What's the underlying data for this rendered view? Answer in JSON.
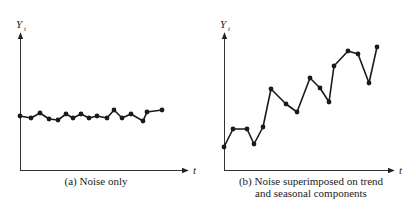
{
  "chart_data": [
    {
      "type": "line",
      "title": "(a) Noise only",
      "xlabel": "t",
      "ylabel": "Y_t",
      "ylabel_main": "Y",
      "ylabel_sub": "t",
      "grid": false,
      "legend": null,
      "markers": true,
      "x": [
        1,
        2,
        3,
        4,
        5,
        6,
        7,
        8,
        9,
        10,
        11,
        12,
        13,
        14,
        15,
        16,
        17
      ],
      "values": [
        116,
        118,
        113,
        119,
        120,
        114,
        118,
        114,
        118,
        116,
        118,
        110,
        118,
        114,
        121,
        112,
        110
      ],
      "pixel_points": [
        [
          20,
          116
        ],
        [
          31,
          118
        ],
        [
          40,
          113
        ],
        [
          49,
          119
        ],
        [
          58,
          120
        ],
        [
          66,
          114
        ],
        [
          73,
          118
        ],
        [
          81,
          114
        ],
        [
          89,
          118
        ],
        [
          97,
          116
        ],
        [
          107,
          118
        ],
        [
          114,
          110
        ],
        [
          122,
          118
        ],
        [
          131,
          114
        ],
        [
          143,
          121
        ],
        [
          147,
          112
        ],
        [
          162,
          110
        ]
      ]
    },
    {
      "type": "line",
      "title": "(b) Noise superimposed on trend and seasonal components",
      "title_lines": [
        "(b) Noise superimposed on trend",
        "and seasonal components"
      ],
      "xlabel": "t",
      "ylabel": "Y_t",
      "ylabel_main": "Y",
      "ylabel_sub": "t",
      "grid": false,
      "legend": null,
      "markers": true,
      "x": [
        1,
        2,
        3,
        4,
        5,
        6,
        7,
        8,
        9,
        10,
        11,
        12,
        13,
        14,
        15,
        16
      ],
      "pixel_points": [
        [
          224,
          147
        ],
        [
          233,
          129
        ],
        [
          247,
          129
        ],
        [
          254,
          144
        ],
        [
          263,
          127
        ],
        [
          271,
          89
        ],
        [
          286,
          104
        ],
        [
          297,
          112
        ],
        [
          310,
          78
        ],
        [
          320,
          88
        ],
        [
          329,
          102
        ],
        [
          334,
          66
        ],
        [
          348,
          51
        ],
        [
          358,
          54
        ],
        [
          369,
          83
        ],
        [
          377,
          47
        ]
      ]
    }
  ],
  "panels": {
    "a": {
      "caption": "(a) Noise only",
      "x_axis_label": "t",
      "y_axis_main": "Y",
      "y_axis_sub": "t"
    },
    "b": {
      "caption_line1": "(b) Noise superimposed on trend",
      "caption_line2": "and seasonal components",
      "x_axis_label": "t",
      "y_axis_main": "Y",
      "y_axis_sub": "t"
    }
  },
  "colors": {
    "line": "#1a1a1a",
    "axis": "#333333",
    "background": "#ffffff"
  }
}
